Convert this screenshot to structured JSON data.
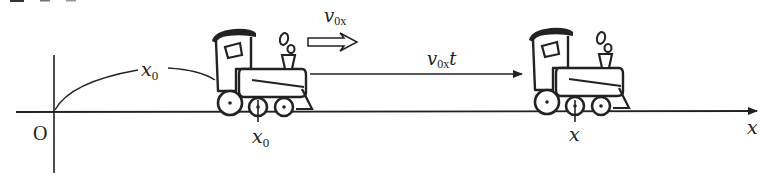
{
  "figure": {
    "header_fragment": "図5-",
    "origin_label": "O",
    "axis_label": "x",
    "velocity_label": {
      "base": "v",
      "sub": "0x"
    },
    "displacement_label": {
      "base": "v",
      "sub": "0x",
      "suffix": "t"
    },
    "initial_position_label": {
      "base": "x",
      "sub": "0"
    },
    "initial_tick_label": {
      "base": "x",
      "sub": "0"
    },
    "final_tick_label": "x",
    "colors": {
      "ink": "#222222",
      "background": "#ffffff"
    },
    "objects": [
      {
        "name": "train-initial",
        "description": "steam locomotive at initial position x0"
      },
      {
        "name": "train-final",
        "description": "steam locomotive at position x after time t"
      }
    ]
  }
}
